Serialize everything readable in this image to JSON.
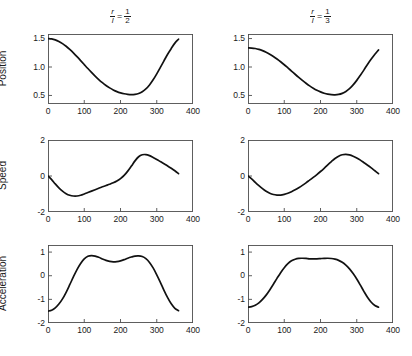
{
  "figure": {
    "width": 412,
    "height": 356,
    "background": "#ffffff",
    "curve_color": "#111111",
    "frame_color": "#4d4d4d"
  },
  "columns": [
    {
      "id": "left",
      "title_prefix_num": "r",
      "title_prefix_den": "l",
      "title_equals": "=",
      "title_value_num": "1",
      "title_value_den": "2",
      "ratio": 0.5
    },
    {
      "id": "right",
      "title_prefix_num": "r",
      "title_prefix_den": "l",
      "title_equals": "=",
      "title_value_num": "1",
      "title_value_den": "3",
      "ratio": 0.3333
    }
  ],
  "rows": [
    {
      "id": "position",
      "ylabel": "Position"
    },
    {
      "id": "speed",
      "ylabel": "Speed"
    },
    {
      "id": "acceleration",
      "ylabel": "Acceleration"
    }
  ],
  "chart_data": [
    {
      "type": "line",
      "id": "position-left",
      "title": "r/l = 1/2",
      "row": "Position",
      "column": "r/l = 1/2",
      "xlabel": "",
      "ylabel": "Position",
      "xlim": [
        0,
        400
      ],
      "ylim": [
        0.35,
        1.58
      ],
      "xticks": [
        0,
        100,
        200,
        300,
        400
      ],
      "yticks": [
        0.5,
        1.0,
        1.5
      ],
      "ytick_labels": [
        "0.5",
        "1.0",
        "1.5"
      ],
      "grid": false,
      "legend": "none",
      "x": [
        0,
        10,
        20,
        30,
        40,
        50,
        60,
        70,
        80,
        90,
        100,
        110,
        120,
        130,
        140,
        150,
        160,
        170,
        180,
        190,
        200,
        210,
        220,
        230,
        240,
        250,
        260,
        270,
        280,
        290,
        300,
        310,
        320,
        330,
        340,
        350,
        360
      ],
      "y": [
        1.5,
        1.494,
        1.477,
        1.449,
        1.411,
        1.364,
        1.309,
        1.248,
        1.182,
        1.113,
        1.043,
        0.973,
        0.905,
        0.84,
        0.78,
        0.725,
        0.676,
        0.633,
        0.597,
        0.568,
        0.546,
        0.53,
        0.52,
        0.516,
        0.52,
        0.535,
        0.566,
        0.615,
        0.685,
        0.775,
        0.88,
        0.995,
        1.11,
        1.225,
        1.325,
        1.42,
        1.488
      ]
    },
    {
      "type": "line",
      "id": "speed-left",
      "title": "r/l = 1/2",
      "row": "Speed",
      "column": "r/l = 1/2",
      "xlabel": "",
      "ylabel": "Speed",
      "xlim": [
        0,
        400
      ],
      "ylim": [
        -2,
        2
      ],
      "xticks": [
        0,
        100,
        200,
        300,
        400
      ],
      "yticks": [
        -2,
        0,
        2
      ],
      "ytick_labels": [
        "-2",
        "0",
        "2"
      ],
      "grid": false,
      "legend": "none",
      "x": [
        0,
        10,
        20,
        30,
        40,
        50,
        60,
        70,
        80,
        90,
        100,
        110,
        120,
        130,
        140,
        150,
        160,
        170,
        180,
        190,
        200,
        210,
        220,
        230,
        240,
        250,
        260,
        270,
        280,
        290,
        300,
        310,
        320,
        330,
        340,
        350,
        360
      ],
      "y": [
        0.0,
        -0.2,
        -0.44,
        -0.66,
        -0.84,
        -0.98,
        -1.07,
        -1.11,
        -1.11,
        -1.07,
        -1.0,
        -0.92,
        -0.84,
        -0.76,
        -0.68,
        -0.6,
        -0.53,
        -0.46,
        -0.38,
        -0.28,
        -0.15,
        0.03,
        0.27,
        0.55,
        0.84,
        1.07,
        1.18,
        1.19,
        1.13,
        1.03,
        0.92,
        0.8,
        0.68,
        0.56,
        0.43,
        0.29,
        0.13
      ]
    },
    {
      "type": "line",
      "id": "acceleration-left",
      "title": "r/l = 1/2",
      "row": "Acceleration",
      "column": "r/l = 1/2",
      "xlabel": "",
      "ylabel": "Acceleration",
      "xlim": [
        0,
        400
      ],
      "ylim": [
        -2,
        1.3
      ],
      "xticks": [
        0,
        100,
        200,
        300,
        400
      ],
      "yticks": [
        -2,
        -1,
        0,
        1
      ],
      "ytick_labels": [
        "-2",
        "-1",
        "0",
        "1"
      ],
      "grid": false,
      "legend": "none",
      "x": [
        0,
        10,
        20,
        30,
        40,
        50,
        60,
        70,
        80,
        90,
        100,
        110,
        120,
        130,
        140,
        150,
        160,
        170,
        180,
        190,
        200,
        210,
        220,
        230,
        240,
        250,
        260,
        270,
        280,
        290,
        300,
        310,
        320,
        330,
        340,
        350,
        360
      ],
      "y": [
        -1.5,
        -1.46,
        -1.36,
        -1.2,
        -0.98,
        -0.7,
        -0.38,
        -0.05,
        0.26,
        0.52,
        0.71,
        0.82,
        0.85,
        0.83,
        0.78,
        0.71,
        0.65,
        0.61,
        0.59,
        0.6,
        0.63,
        0.68,
        0.74,
        0.79,
        0.83,
        0.84,
        0.81,
        0.72,
        0.56,
        0.33,
        0.04,
        -0.28,
        -0.62,
        -0.93,
        -1.19,
        -1.38,
        -1.48
      ]
    },
    {
      "type": "line",
      "id": "position-right",
      "title": "r/l = 1/3",
      "row": "Position",
      "column": "r/l = 1/3",
      "xlabel": "",
      "ylabel": "Position",
      "xlim": [
        0,
        400
      ],
      "ylim": [
        0.35,
        1.58
      ],
      "xticks": [
        0,
        100,
        200,
        300,
        400
      ],
      "yticks": [
        0.5,
        1.0,
        1.5
      ],
      "ytick_labels": [
        "0.5",
        "1.0",
        "1.5"
      ],
      "grid": false,
      "legend": "none",
      "x": [
        0,
        10,
        20,
        30,
        40,
        50,
        60,
        70,
        80,
        90,
        100,
        110,
        120,
        130,
        140,
        150,
        160,
        170,
        180,
        190,
        200,
        210,
        220,
        230,
        240,
        250,
        260,
        270,
        280,
        290,
        300,
        310,
        320,
        330,
        340,
        350,
        360
      ],
      "y": [
        1.335,
        1.333,
        1.325,
        1.31,
        1.288,
        1.26,
        1.226,
        1.186,
        1.141,
        1.092,
        1.04,
        0.985,
        0.929,
        0.873,
        0.818,
        0.765,
        0.715,
        0.669,
        0.628,
        0.592,
        0.563,
        0.54,
        0.523,
        0.513,
        0.511,
        0.518,
        0.537,
        0.57,
        0.62,
        0.685,
        0.765,
        0.855,
        0.95,
        1.05,
        1.14,
        1.225,
        1.3
      ]
    },
    {
      "type": "line",
      "id": "speed-right",
      "title": "r/l = 1/3",
      "row": "Speed",
      "column": "r/l = 1/3",
      "xlabel": "",
      "ylabel": "Speed",
      "xlim": [
        0,
        400
      ],
      "ylim": [
        -2,
        2
      ],
      "xticks": [
        0,
        100,
        200,
        300,
        400
      ],
      "yticks": [
        -2,
        0,
        2
      ],
      "ytick_labels": [
        "-2",
        "0",
        "2"
      ],
      "grid": false,
      "legend": "none",
      "x": [
        0,
        10,
        20,
        30,
        40,
        50,
        60,
        70,
        80,
        90,
        100,
        110,
        120,
        130,
        140,
        150,
        160,
        170,
        180,
        190,
        200,
        210,
        220,
        230,
        240,
        250,
        260,
        270,
        280,
        290,
        300,
        310,
        320,
        330,
        340,
        350,
        360
      ],
      "y": [
        0.0,
        -0.16,
        -0.35,
        -0.53,
        -0.7,
        -0.85,
        -0.96,
        -1.03,
        -1.06,
        -1.06,
        -1.02,
        -0.96,
        -0.87,
        -0.77,
        -0.65,
        -0.52,
        -0.38,
        -0.23,
        -0.08,
        0.08,
        0.25,
        0.43,
        0.62,
        0.8,
        0.97,
        1.1,
        1.18,
        1.2,
        1.17,
        1.1,
        1.0,
        0.88,
        0.74,
        0.6,
        0.45,
        0.29,
        0.13
      ]
    },
    {
      "type": "line",
      "id": "acceleration-right",
      "title": "r/l = 1/3",
      "row": "Acceleration",
      "column": "r/l = 1/3",
      "xlabel": "",
      "ylabel": "Acceleration",
      "xlim": [
        0,
        400
      ],
      "ylim": [
        -2,
        1.3
      ],
      "xticks": [
        0,
        100,
        200,
        300,
        400
      ],
      "yticks": [
        -2,
        -1,
        0,
        1
      ],
      "ytick_labels": [
        "-2",
        "-1",
        "0",
        "1"
      ],
      "grid": false,
      "legend": "none",
      "x": [
        0,
        10,
        20,
        30,
        40,
        50,
        60,
        70,
        80,
        90,
        100,
        110,
        120,
        130,
        140,
        150,
        160,
        170,
        180,
        190,
        200,
        210,
        220,
        230,
        240,
        250,
        260,
        270,
        280,
        290,
        300,
        310,
        320,
        330,
        340,
        350,
        360
      ],
      "y": [
        -1.33,
        -1.31,
        -1.25,
        -1.15,
        -1.0,
        -0.82,
        -0.6,
        -0.36,
        -0.11,
        0.13,
        0.34,
        0.51,
        0.63,
        0.7,
        0.735,
        0.74,
        0.73,
        0.715,
        0.71,
        0.715,
        0.725,
        0.735,
        0.74,
        0.73,
        0.7,
        0.65,
        0.57,
        0.45,
        0.29,
        0.09,
        -0.14,
        -0.4,
        -0.67,
        -0.92,
        -1.12,
        -1.26,
        -1.33
      ]
    }
  ],
  "xtick_labels": [
    "0",
    "100",
    "200",
    "300",
    "400"
  ]
}
